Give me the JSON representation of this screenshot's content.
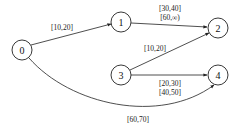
{
  "diagram": {
    "type": "directed-graph",
    "nodes": [
      {
        "id": "0",
        "label": "0",
        "x": 22,
        "y": 50
      },
      {
        "id": "1",
        "label": "1",
        "x": 121,
        "y": 22
      },
      {
        "id": "2",
        "label": "2",
        "x": 218,
        "y": 28
      },
      {
        "id": "3",
        "label": "3",
        "x": 121,
        "y": 75
      },
      {
        "id": "4",
        "label": "4",
        "x": 218,
        "y": 75
      }
    ],
    "edges": [
      {
        "from": "0",
        "to": "1",
        "labels": [
          "[10,20]"
        ]
      },
      {
        "from": "1",
        "to": "2",
        "labels": [
          "[30,40]",
          "[60,∞)"
        ]
      },
      {
        "from": "3",
        "to": "2",
        "labels": [
          "[10,20]"
        ]
      },
      {
        "from": "3",
        "to": "4",
        "labels": [
          "[20,30]",
          "[40,50]"
        ]
      },
      {
        "from": "0",
        "to": "4",
        "labels": [
          "[60,70]"
        ]
      }
    ]
  }
}
